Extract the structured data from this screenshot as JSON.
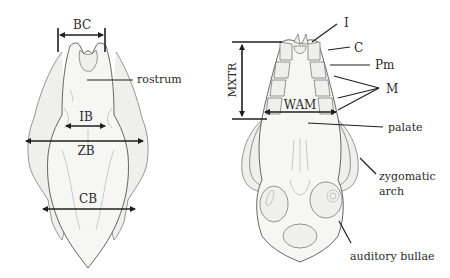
{
  "figure": {
    "type": "skull-measurement-diagram",
    "views": [
      {
        "id": "dorsal",
        "measurements": [
          {
            "abbr": "BC"
          },
          {
            "abbr": "IB"
          },
          {
            "abbr": "ZB"
          },
          {
            "abbr": "CB"
          }
        ],
        "labels": [
          {
            "text": "rostrum"
          }
        ]
      },
      {
        "id": "ventral",
        "measurements": [
          {
            "abbr": "MXTR"
          },
          {
            "abbr": "WAM"
          }
        ],
        "labels": [
          {
            "text": "I"
          },
          {
            "text": "C"
          },
          {
            "text": "Pm"
          },
          {
            "text": "M"
          },
          {
            "text": "palate"
          },
          {
            "text": "zygomatic"
          },
          {
            "text": "arch"
          },
          {
            "text": "auditory bullae"
          }
        ]
      }
    ]
  }
}
